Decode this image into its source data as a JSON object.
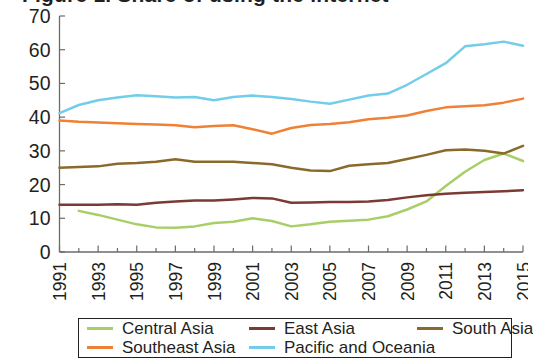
{
  "figure": {
    "title_cut_off": "Figure 1. Share of using the internet",
    "background": "#ffffff"
  },
  "axes": {
    "y_ticks": [
      "0",
      "10",
      "20",
      "30",
      "40",
      "50",
      "60",
      "70"
    ],
    "x_ticks": [
      "1991",
      "1993",
      "1995",
      "1997",
      "1999",
      "2001",
      "2003",
      "2005",
      "2007",
      "2009",
      "2011",
      "2013",
      "2015"
    ],
    "axis_color": "#6e6a68"
  },
  "legend": {
    "rows": [
      [
        {
          "label": "Central Asia",
          "color": "#a8cf66"
        },
        {
          "label": "East Asia",
          "color": "#7b3a34"
        },
        {
          "label": "South Asia",
          "color": "#8a6a2a"
        }
      ],
      [
        {
          "label": "Southeast Asia",
          "color": "#ef8136"
        },
        {
          "label": "Pacific and Oceania",
          "color": "#73cdea"
        }
      ]
    ]
  },
  "chart_data": {
    "type": "line",
    "title": "Figure 1. Share of using the internet",
    "xlabel": "",
    "ylabel": "",
    "xlim": [
      1991,
      2015
    ],
    "ylim": [
      0,
      70
    ],
    "yticks": [
      0,
      10,
      20,
      30,
      40,
      50,
      60,
      70
    ],
    "xticks": [
      1991,
      1993,
      1995,
      1997,
      1999,
      2001,
      2003,
      2005,
      2007,
      2009,
      2011,
      2013,
      2015
    ],
    "grid": false,
    "legend_position": "below",
    "x": [
      1991,
      1992,
      1993,
      1994,
      1995,
      1996,
      1997,
      1998,
      1999,
      2000,
      2001,
      2002,
      2003,
      2004,
      2005,
      2006,
      2007,
      2008,
      2009,
      2010,
      2011,
      2012,
      2013,
      2014,
      2015
    ],
    "series": [
      {
        "name": "Central Asia",
        "color": "#a8cf66",
        "values": [
          null,
          12.2,
          11.0,
          9.6,
          8.2,
          7.3,
          7.2,
          7.6,
          8.6,
          9.0,
          10.0,
          9.2,
          7.6,
          8.2,
          9.0,
          9.3,
          9.6,
          10.6,
          12.6,
          15.0,
          19.6,
          23.8,
          27.3,
          29.2,
          27.0
        ]
      },
      {
        "name": "Southeast Asia",
        "color": "#ef8136",
        "values": [
          39.0,
          38.6,
          38.4,
          38.2,
          38.0,
          37.8,
          37.6,
          37.0,
          37.4,
          37.6,
          36.4,
          35.1,
          36.8,
          37.7,
          38.0,
          38.5,
          39.4,
          39.8,
          40.5,
          41.8,
          42.9,
          43.2,
          43.5,
          44.3,
          45.5
        ]
      },
      {
        "name": "East Asia",
        "color": "#7b3a34",
        "values": [
          14.0,
          14.0,
          14.0,
          14.2,
          14.0,
          14.6,
          15.0,
          15.3,
          15.3,
          15.6,
          16.0,
          15.9,
          14.6,
          14.7,
          14.8,
          14.8,
          15.0,
          15.4,
          16.2,
          16.8,
          17.3,
          17.6,
          17.8,
          18.0,
          18.3
        ]
      },
      {
        "name": "South Asia",
        "color": "#8a6a2a",
        "values": [
          25.0,
          25.2,
          25.4,
          26.2,
          26.4,
          26.8,
          27.5,
          26.8,
          26.8,
          26.8,
          26.4,
          26.0,
          25.0,
          24.2,
          24.0,
          25.6,
          26.0,
          26.4,
          27.6,
          28.8,
          30.2,
          30.4,
          30.0,
          29.2,
          31.5
        ]
      },
      {
        "name": "Pacific and Oceania",
        "color": "#73cdea",
        "values": [
          41.2,
          43.6,
          45.0,
          45.8,
          46.5,
          46.2,
          45.8,
          46.0,
          45.0,
          46.0,
          46.4,
          46.0,
          45.4,
          44.6,
          44.0,
          45.2,
          46.4,
          47.0,
          49.6,
          52.8,
          56.0,
          61.0,
          61.6,
          62.4,
          61.2
        ]
      }
    ]
  }
}
